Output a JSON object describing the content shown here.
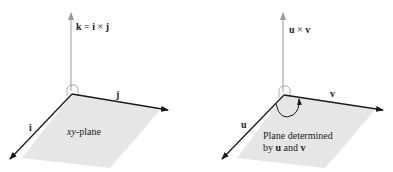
{
  "figures": [
    {
      "id": "left",
      "vertical_label": "k = i × j",
      "vertical_label_parts": {
        "k": "k",
        "eq": " = ",
        "i": "i",
        "times": " × ",
        "j": "j"
      },
      "axis_right_label": "j",
      "axis_left_label": "i",
      "plane_label": "xy-plane",
      "plane_label_parts": {
        "xy": "xy",
        "rest": "-plane"
      }
    },
    {
      "id": "right",
      "vertical_label": "u × v",
      "vertical_label_parts": {
        "u": "u",
        "times": " × ",
        "v": "v"
      },
      "axis_right_label": "v",
      "axis_left_label": "u",
      "plane_label_line1": "Plane determined",
      "plane_label_line2_parts": {
        "by": "by ",
        "u": "u",
        "and": " and ",
        "v": "v"
      }
    }
  ],
  "colors": {
    "plane_fill": "#e6e6e6",
    "axis_dark": "#1a1a1a",
    "axis_light": "#9a9a9a"
  }
}
